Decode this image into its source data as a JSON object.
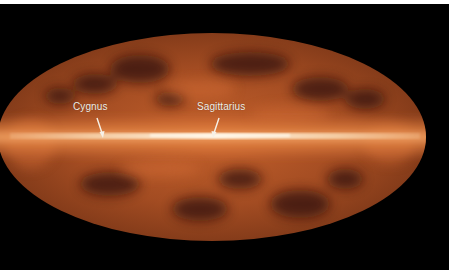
{
  "image": {
    "description": "All-sky map in Mollweide projection showing Milky Way galactic plane glow",
    "colors": {
      "background": "#000000",
      "border": "#ffffff",
      "sky_dark": "#3a1a0c",
      "sky_mid": "#9a4a22",
      "sky_bright": "#e07a3c",
      "plane_core": "#fbe3c2"
    }
  },
  "annotations": [
    {
      "label": "Cygnus",
      "arrow_to": "galactic plane (Cygnus region)"
    },
    {
      "label": "Sagittarius",
      "arrow_to": "galactic center (Sagittarius)"
    }
  ]
}
